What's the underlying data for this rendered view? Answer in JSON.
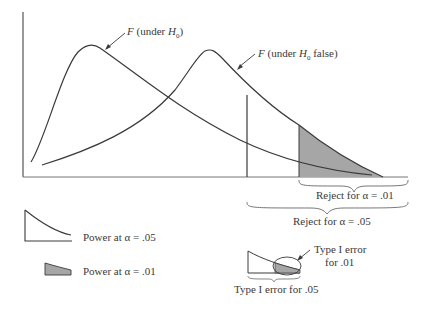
{
  "diagram": {
    "curves": [
      {
        "name": "F (under H0)",
        "label_prefix": "F",
        "label_text": "(under ",
        "label_var": "H",
        "label_sub": "0",
        "label_suffix": ")"
      },
      {
        "name": "F (under H0 false)",
        "label_prefix": "F",
        "label_text": "(under ",
        "label_var": "H",
        "label_sub": "0",
        "label_suffix": " false)"
      }
    ],
    "regions": {
      "reject_01": "Reject for α = .01",
      "reject_05": "Reject for α = .05"
    },
    "legend": {
      "power_05": "Power at α = .05",
      "power_01": "Power at α = .01"
    },
    "inset": {
      "type1_01_line1": "Type I error",
      "type1_01_line2": "for .01",
      "type1_05": "Type I error for .05"
    },
    "colors": {
      "line": "#3a3a3a",
      "shade": "#a6a6a6"
    }
  }
}
